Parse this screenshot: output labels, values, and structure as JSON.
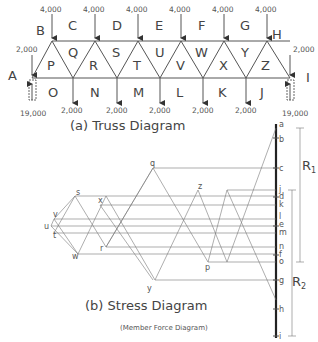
{
  "truss_diagram": {
    "caption": "(a) Truss Diagram",
    "top_loads": [
      "4,000",
      "4,000",
      "4,000",
      "4,000",
      "4,000",
      "4,000",
      "4,000"
    ],
    "end_loads": {
      "left": "2,000",
      "right": "2,000"
    },
    "bottom_loads": [
      "2,000",
      "2,000",
      "2,000",
      "2,000",
      "2,000",
      "2,000"
    ],
    "reactions": {
      "left": "19,000",
      "right": "19,000"
    },
    "outer_spaces": {
      "top": [
        "B",
        "C",
        "D",
        "E",
        "F",
        "G",
        "H"
      ],
      "left": "A",
      "right": "I",
      "bottom": [
        "O",
        "N",
        "M",
        "L",
        "K",
        "J"
      ]
    },
    "panels": [
      "P",
      "Q",
      "R",
      "S",
      "T",
      "U",
      "V",
      "W",
      "X",
      "Y",
      "Z"
    ]
  },
  "stress_diagram": {
    "caption": "(b) Stress Diagram",
    "subcaption": "(Member Force Diagram)",
    "load_line_labels": [
      "a",
      "b",
      "c",
      "j",
      "d",
      "k",
      "l",
      "e",
      "m",
      "n",
      "f",
      "o",
      "g",
      "h",
      "i"
    ],
    "point_labels": [
      "q",
      "s",
      "x",
      "v",
      "u",
      "t",
      "w",
      "r",
      "y",
      "z",
      "p"
    ],
    "reaction_labels": {
      "r1": "R1",
      "r2": "R2"
    }
  }
}
